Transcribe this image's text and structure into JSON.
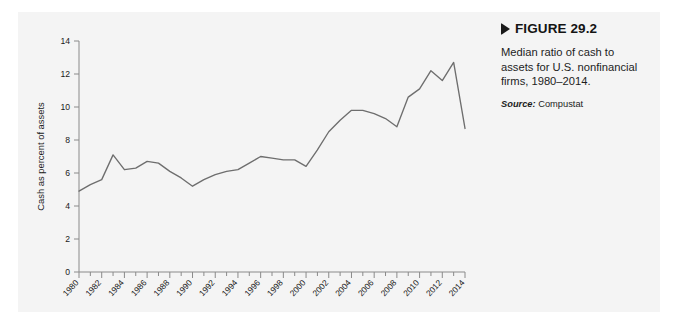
{
  "figure": {
    "marker_icon": "triangle-right-icon",
    "number_label": "FIGURE 29.2",
    "description": "Median ratio of cash to assets for U.S. nonfinancial firms, 1980–2014.",
    "source_label": "Source:",
    "source_value": "Compustat"
  },
  "chart_data": {
    "type": "line",
    "title": "",
    "subtitle": "",
    "xlabel": "",
    "ylabel": "Cash as percent of assets",
    "xlim": [
      1980,
      2014
    ],
    "ylim": [
      0,
      14
    ],
    "grid": false,
    "legend": "none",
    "line_color": "#6e6e6e",
    "axis_color": "#8a8a8a",
    "y_ticks": [
      0,
      2,
      4,
      6,
      8,
      10,
      12,
      14
    ],
    "x_ticks": [
      1980,
      1982,
      1984,
      1986,
      1988,
      1990,
      1992,
      1994,
      1996,
      1998,
      2000,
      2002,
      2004,
      2006,
      2008,
      2010,
      2012,
      2014
    ],
    "x_minor_step": 1,
    "x": [
      1980,
      1981,
      1982,
      1983,
      1984,
      1985,
      1986,
      1987,
      1988,
      1989,
      1990,
      1991,
      1992,
      1993,
      1994,
      1995,
      1996,
      1997,
      1998,
      1999,
      2000,
      2001,
      2002,
      2003,
      2004,
      2005,
      2006,
      2007,
      2008,
      2009,
      2010,
      2011,
      2012,
      2013,
      2014
    ],
    "series": [
      {
        "name": "Median cash / assets",
        "values": [
          4.9,
          5.3,
          5.6,
          7.1,
          6.2,
          6.3,
          6.7,
          6.6,
          6.1,
          5.7,
          5.2,
          5.6,
          5.9,
          6.1,
          6.2,
          6.6,
          7.0,
          6.9,
          6.8,
          6.8,
          6.4,
          7.4,
          8.5,
          9.2,
          9.8,
          9.8,
          9.6,
          9.3,
          8.8,
          10.6,
          11.1,
          12.2,
          11.6,
          12.7,
          8.7
        ]
      }
    ],
    "annotations": []
  }
}
